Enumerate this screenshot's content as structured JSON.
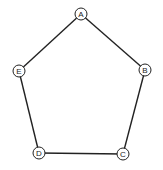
{
  "diagram": {
    "type": "graph",
    "shape": "pentagon",
    "nodes": [
      {
        "id": "A",
        "label": "A",
        "x": 81,
        "y": 14
      },
      {
        "id": "B",
        "label": "B",
        "x": 145,
        "y": 70
      },
      {
        "id": "C",
        "label": "C",
        "x": 123,
        "y": 154
      },
      {
        "id": "D",
        "label": "D",
        "x": 39,
        "y": 153
      },
      {
        "id": "E",
        "label": "E",
        "x": 19,
        "y": 71
      }
    ],
    "edges": [
      {
        "from": "A",
        "to": "B"
      },
      {
        "from": "B",
        "to": "C"
      },
      {
        "from": "C",
        "to": "D"
      },
      {
        "from": "D",
        "to": "E"
      },
      {
        "from": "E",
        "to": "A"
      }
    ],
    "node_radius": 6,
    "stroke_color": "#222222"
  }
}
